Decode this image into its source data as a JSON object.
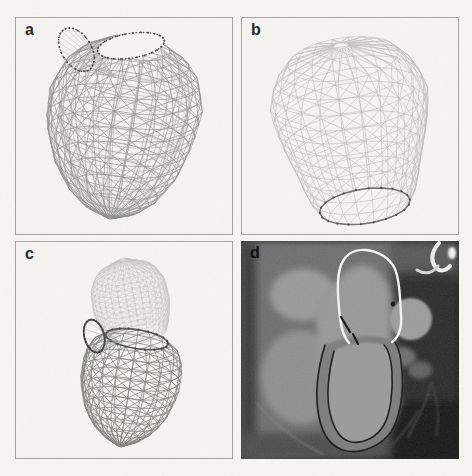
{
  "figure": {
    "panels": [
      {
        "id": "a",
        "label": "a",
        "content": "left-ventricle-wireframe-mesh"
      },
      {
        "id": "b",
        "label": "b",
        "content": "left-atrium-wireframe-mesh"
      },
      {
        "id": "c",
        "label": "c",
        "content": "combined-atrium-ventricle-mesh"
      },
      {
        "id": "d",
        "label": "d",
        "content": "cardiac-ct-slice-with-contours"
      }
    ],
    "colors": {
      "page_bg": "#f6f5f2",
      "panel_bg": "#f5f4f1",
      "panel_border": "#a2a29e",
      "label_dark": "#262626",
      "lv_mesh": "#8d8d88",
      "lv_mesh_inner": "#a4a49f",
      "la_mesh_light": "#bdbdb9",
      "la_mesh_fine": "#c6c6c2",
      "rim_dark": "#4a4a48",
      "ct_white_contour": "#f4f4f1",
      "ct_dark_contour": "#1f1f1d"
    },
    "meshes": {
      "panel_a": {
        "lv_outer": {
          "rim": [
            122,
            30
          ],
          "apex": [
            95,
            202
          ],
          "sinTilt": 0.36,
          "cols": 22,
          "rows": 13,
          "profile": [
            [
              0,
              34
            ],
            [
              0.05,
              52
            ],
            [
              0.15,
              68
            ],
            [
              0.3,
              78
            ],
            [
              0.5,
              75
            ],
            [
              0.7,
              63
            ],
            [
              0.85,
              45
            ],
            [
              0.95,
              24
            ],
            [
              1,
              2
            ]
          ],
          "bend": [
            [
              0,
              0
            ],
            [
              0.5,
              4
            ],
            [
              1,
              0
            ]
          ],
          "stroke": "#8d8d88",
          "width": 0.7,
          "diagonals": true
        },
        "lv_inner": {
          "rim": [
            122,
            32
          ],
          "apex": [
            97,
            196
          ],
          "sinTilt": 0.36,
          "cols": 22,
          "rows": 13,
          "scale": 0.84,
          "profile": [
            [
              0,
              34
            ],
            [
              0.05,
              52
            ],
            [
              0.15,
              68
            ],
            [
              0.3,
              78
            ],
            [
              0.5,
              75
            ],
            [
              0.7,
              63
            ],
            [
              0.85,
              45
            ],
            [
              0.95,
              24
            ],
            [
              1,
              2
            ]
          ],
          "bend": [
            [
              0,
              0
            ],
            [
              0.5,
              4
            ],
            [
              1,
              0
            ]
          ],
          "stroke": "#a4a49f",
          "width": 0.55,
          "diagonals": false
        },
        "mitral_ring": {
          "center": [
            116,
            28
          ],
          "rx": 34,
          "ry": 12.5,
          "rot": -9,
          "color": "#4f4f4d",
          "width": 1.4,
          "dotted": true,
          "fillBg": true,
          "dots": true,
          "dotColor": "#4a4a48"
        },
        "aortic_ring": {
          "center": [
            61,
            32
          ],
          "rx": 15,
          "ry": 24,
          "rot": -32,
          "color": "#4f4f4d",
          "width": 1.2,
          "dotted": true,
          "dots": true,
          "dotColor": "#4a4a48"
        },
        "fan": {
          "focus": [
            100,
            60
          ],
          "count": 18,
          "stroke": "#b1b1ad",
          "width": 0.5
        }
      },
      "panel_b": {
        "la": {
          "rim": [
            124,
            190
          ],
          "apex": [
            100,
            28
          ],
          "sinTilt": 0.38,
          "cols": 22,
          "rows": 12,
          "profile": [
            [
              0,
              46
            ],
            [
              0.1,
              56
            ],
            [
              0.25,
              63
            ],
            [
              0.45,
              74
            ],
            [
              0.65,
              81
            ],
            [
              0.8,
              74
            ],
            [
              0.92,
              56
            ],
            [
              1,
              8
            ]
          ],
          "stroke": "#bdbdb9",
          "width": 0.65,
          "diagonals": true,
          "rimRing": {
            "color": "#6e6e6c",
            "width": 1.5,
            "dots": true,
            "dotColor": "#4a4a48"
          }
        }
      },
      "panel_c": {
        "la_fine": {
          "rim": [
            122,
            94
          ],
          "apex": [
            108,
            18
          ],
          "sinTilt": 0.3,
          "cols": 30,
          "rows": 15,
          "profile": [
            [
              0,
              30
            ],
            [
              0.15,
              35
            ],
            [
              0.4,
              39
            ],
            [
              0.65,
              38
            ],
            [
              0.85,
              30
            ],
            [
              1,
              4
            ]
          ],
          "stroke": "#c6c6c2",
          "width": 0.5,
          "diagonals": true
        },
        "lv": {
          "rim": [
            122,
            98
          ],
          "apex": [
            105,
            206
          ],
          "sinTilt": 0.3,
          "cols": 20,
          "rows": 12,
          "profile": [
            [
              0,
              32
            ],
            [
              0.06,
              43
            ],
            [
              0.2,
              50
            ],
            [
              0.45,
              50
            ],
            [
              0.7,
              41
            ],
            [
              0.85,
              28
            ],
            [
              0.95,
              14
            ],
            [
              1,
              2
            ]
          ],
          "stroke": "#82827d",
          "width": 0.8,
          "diagonals": true,
          "rimRing": {
            "color": "#565654",
            "width": 1.6,
            "dots": true,
            "dotColor": "#3f3f3d"
          }
        },
        "aortic_ring": {
          "center": [
            79,
            95
          ],
          "rx": 10,
          "ry": 17,
          "rot": -15,
          "color": "#4c4c4a",
          "width": 1.8,
          "dots": true,
          "dotColor": "#3f3f3d"
        },
        "fan": {
          "focus": [
            103,
            100
          ],
          "count": 10,
          "stroke": "#9e9e9a",
          "width": 0.5
        }
      }
    },
    "ct": {
      "grain_opacity": 0.12,
      "base": [
        {
          "k": "rect",
          "x": 0,
          "y": 0,
          "w": 218,
          "h": 218,
          "fill": "#141414"
        },
        {
          "k": "path",
          "d": "M0,0 L152,0 C176,28 181,62 174,98 C169,142 159,183 132,213 L0,218 Z",
          "fill": "#6c6c6c",
          "blur": 3
        },
        {
          "k": "rect",
          "x": 148,
          "y": 0,
          "w": 70,
          "h": 40,
          "fill": "#545454",
          "blur": 4
        },
        {
          "k": "rect",
          "x": 0,
          "y": 0,
          "w": 15,
          "h": 218,
          "fill": "#363636",
          "blur": 4
        },
        {
          "k": "rect",
          "x": 0,
          "y": 192,
          "w": 150,
          "h": 26,
          "fill": "#4a4a4a",
          "blur": 4
        },
        {
          "k": "ellipse",
          "cx": 62,
          "cy": 54,
          "rx": 33,
          "ry": 26,
          "fill": "#999999",
          "blur": 3
        },
        {
          "k": "ellipse",
          "cx": 60,
          "cy": 136,
          "rx": 40,
          "ry": 47,
          "fill": "#8e8e8e",
          "blur": 3
        },
        {
          "k": "ellipse",
          "cx": 100,
          "cy": 76,
          "rx": 26,
          "ry": 32,
          "fill": "#949494",
          "blur": 3
        },
        {
          "k": "ellipse",
          "cx": 118,
          "cy": 112,
          "rx": 42,
          "ry": 88,
          "rot": 3,
          "fill": "#979797",
          "blur": 3
        },
        {
          "k": "rect",
          "x": 153,
          "y": 32,
          "w": 65,
          "h": 128,
          "fill": "#262626",
          "blur": 4
        },
        {
          "k": "ellipse",
          "cx": 170,
          "cy": 78,
          "rx": 21,
          "ry": 21,
          "fill": "#9c9c9c",
          "blur": 1.2
        },
        {
          "k": "ellipse",
          "cx": 152,
          "cy": 63,
          "rx": 2.4,
          "ry": 2.4,
          "fill": "#0f0f0f",
          "blur": 0.6
        },
        {
          "k": "ellipse",
          "cx": 161,
          "cy": 116,
          "rx": 14,
          "ry": 10,
          "fill": "#6a6a6a",
          "blur": 2
        },
        {
          "k": "ellipse",
          "cx": 179,
          "cy": 129,
          "rx": 12,
          "ry": 9,
          "fill": "#5f5f5f",
          "blur": 2
        },
        {
          "k": "ellipse",
          "cx": 152,
          "cy": 139,
          "rx": 10,
          "ry": 8,
          "fill": "#646464",
          "blur": 2
        },
        {
          "k": "path",
          "d": "M198,2 C191,10 189,19 195,27 C199,31 205,30 209,25",
          "stroke": "#f0f0ee",
          "w": 4,
          "blur": 0.6
        },
        {
          "k": "path",
          "d": "M176,29 C184,34 192,32 197,25",
          "stroke": "#d8d8d6",
          "w": 3,
          "blur": 0.6
        },
        {
          "k": "ellipse",
          "cx": 211,
          "cy": 12,
          "rx": 4,
          "ry": 6,
          "fill": "#f4f4f2",
          "blur": 0.8
        },
        {
          "k": "path",
          "d": "M190,142 C186,162 176,178 167,196",
          "stroke": "#3e3e3e",
          "w": 2,
          "blur": 1
        },
        {
          "k": "path",
          "d": "M191,142 C197,160 199,178 195,194",
          "stroke": "#383838",
          "w": 1.8,
          "blur": 1
        },
        {
          "k": "path",
          "d": "M177,170 C170,183 161,194 149,206",
          "stroke": "#3a3a3a",
          "w": 1.8,
          "blur": 1
        },
        {
          "k": "path",
          "d": "M16,162 C36,186 58,202 82,213",
          "stroke": "#8e8e8e",
          "w": 1.6,
          "blur": 1,
          "opacity": 0.55
        }
      ],
      "overlays": [
        {
          "k": "path",
          "d": "M84,104 C76,130 74,156 78,176 C82,196 92,207 105,210 C122,213 141,204 150,191 C159,177 163,152 161,130 C160,114 157,104 152,99 C134,92 102,95 84,104 Z",
          "fill": "#7e7e7e",
          "blur": 0.8
        },
        {
          "k": "path",
          "d": "M93,110 C87,132 85,156 89,172 C93,190 101,199 110,201 C123,203 136,196 143,184 C150,171 152,149 151,131 C150,117 147,108 143,104 C128,99 106,102 93,110 Z",
          "fill": "#9b9b9b",
          "blur": 0.8
        },
        {
          "k": "path",
          "d": "M84,104 C76,130 74,156 78,176 C82,196 92,207 105,210 C122,213 141,204 150,191 C159,177 163,152 161,130 C160,114 157,104 152,99",
          "stroke": "#1f1f1d",
          "w": 1.7
        },
        {
          "k": "path",
          "d": "M93,110 C87,132 85,156 89,172 C93,190 101,199 110,201 C123,203 136,196 143,184 C150,171 152,149 151,131 C150,117 147,108 143,104",
          "stroke": "#1f1f1d",
          "w": 1.6
        },
        {
          "k": "path",
          "d": "M108,102 C102,95 100,86 99,77 C97,58 95,38 100,24 C105,12 115,8 125,9 C137,10 149,17 154,28 C159,40 159,57 160,73 C161,86 158,96 151,101",
          "stroke": "#f4f4f1",
          "w": 2.4
        },
        {
          "k": "path",
          "d": "M100,76 L109,91",
          "stroke": "#161616",
          "w": 2.2
        },
        {
          "k": "path",
          "d": "M112,93 L117,103",
          "stroke": "#161616",
          "w": 2
        }
      ]
    }
  }
}
